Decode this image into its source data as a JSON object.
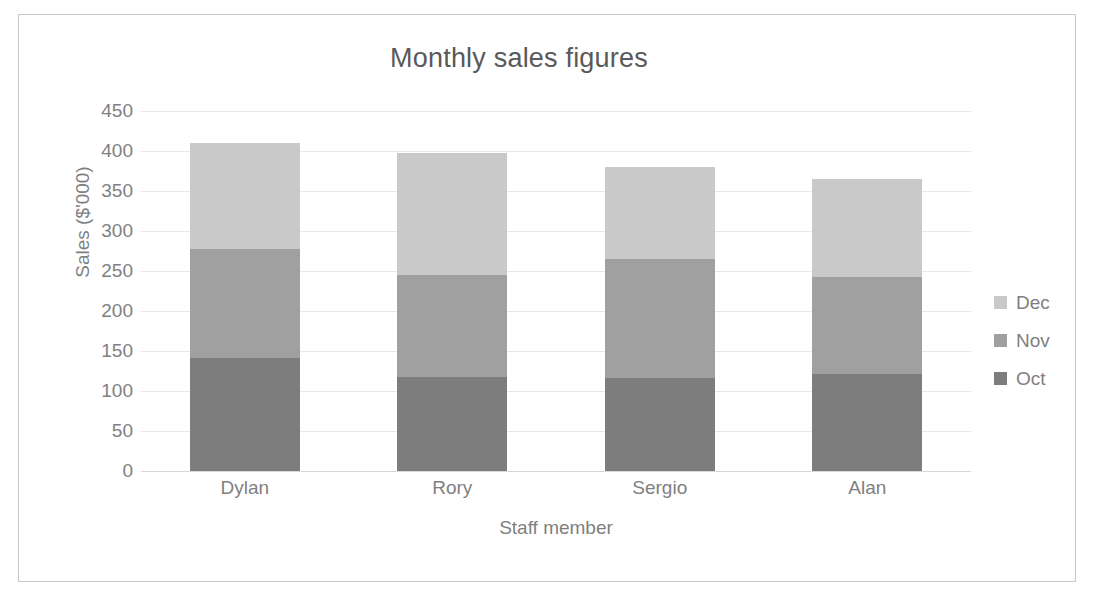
{
  "chart_data": {
    "type": "bar",
    "subtype": "stacked-column",
    "title": "Monthly sales figures",
    "xlabel": "Staff member",
    "ylabel": "Sales ($'000)",
    "categories": [
      "Dylan",
      "Rory",
      "Sergio",
      "Alan"
    ],
    "series": [
      {
        "name": "Oct",
        "color": "#7d7d7d",
        "values": [
          141,
          118,
          116,
          121
        ]
      },
      {
        "name": "Nov",
        "color": "#a0a0a0",
        "values": [
          137,
          127,
          149,
          121
        ]
      },
      {
        "name": "Dec",
        "color": "#c9c9c9",
        "values": [
          132,
          152,
          115,
          123
        ]
      }
    ],
    "totals": [
      410,
      397,
      380,
      365
    ],
    "ylim": [
      0,
      450
    ],
    "ytick_step": 50,
    "yticks": [
      "450",
      "400",
      "350",
      "300",
      "250",
      "200",
      "150",
      "100",
      "50",
      "0"
    ],
    "grid": true,
    "grid_axis": "y",
    "legend_position": "right",
    "legend_order": [
      "Dec",
      "Nov",
      "Oct"
    ],
    "background": "#ffffff",
    "border_color": "#c8c8c8",
    "text_color": "#7f7f7f"
  }
}
